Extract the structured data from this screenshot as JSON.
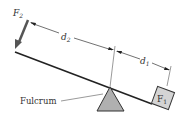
{
  "diagram": {
    "labels": {
      "force_left": "F",
      "force_left_sub": "2",
      "distance_left": "d",
      "distance_left_sub": "2",
      "distance_right": "d",
      "distance_right_sub": "1",
      "force_right": "F",
      "force_right_sub": "1",
      "fulcrum": "Fulcrum"
    },
    "colors": {
      "line": "#222222",
      "arrow": "#555555",
      "fulcrum_fill": "#b0b0b0",
      "box_fill": "#d4d4d4",
      "text": "#333333"
    }
  }
}
